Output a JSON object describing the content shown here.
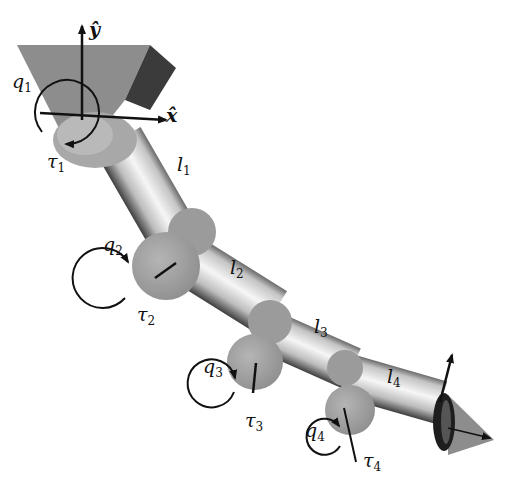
{
  "figure": {
    "axes": {
      "x_label": "x̂",
      "y_label": "ŷ"
    },
    "joints": [
      {
        "angle": "q",
        "angle_sub": "1",
        "torque": "τ",
        "torque_sub": "1"
      },
      {
        "angle": "q",
        "angle_sub": "2",
        "torque": "τ",
        "torque_sub": "2"
      },
      {
        "angle": "q",
        "angle_sub": "3",
        "torque": "τ",
        "torque_sub": "3"
      },
      {
        "angle": "q",
        "angle_sub": "4",
        "torque": "τ",
        "torque_sub": "4"
      }
    ],
    "links": [
      {
        "name": "l",
        "sub": "1"
      },
      {
        "name": "l",
        "sub": "2"
      },
      {
        "name": "l",
        "sub": "3"
      },
      {
        "name": "l",
        "sub": "4"
      }
    ],
    "colors": {
      "base": "#8a8a8a",
      "base_side": "#3a3a3a",
      "joint": "#9a9a9a",
      "link_light": "#f2f2f2",
      "link_dark": "#5a5a5a",
      "ink": "#111111"
    }
  }
}
